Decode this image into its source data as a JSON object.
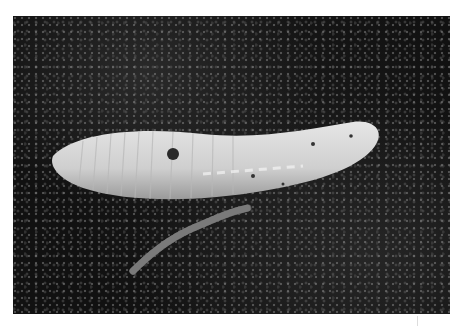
{
  "image": {
    "subject": "pale segmented legless burrowing animal on dark soil",
    "secondary_subject": "small dark earthworm",
    "colors": {
      "background": "#ffffff",
      "soil": "#151515",
      "body": "#d6d6d6"
    }
  }
}
